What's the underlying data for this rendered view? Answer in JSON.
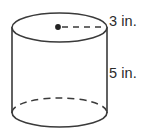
{
  "figure": {
    "type": "cylinder-diagram",
    "shape_name": "cylinder",
    "background_color": "#ffffff",
    "stroke_color": "#3a3a3a",
    "text_color": "#2b2b2b",
    "labels": {
      "radius": "3 in.",
      "height": "5 in."
    },
    "measurements": {
      "radius_value": 3,
      "radius_units": "in.",
      "height_value": 5,
      "height_units": "in."
    },
    "geometry": {
      "center_x": 59.5,
      "radius_x": 47.5,
      "radius_y": 14.5,
      "top_center_y": 27.5,
      "bottom_center_y": 112.5,
      "center_dot_x": 58,
      "center_dot_y": 27,
      "center_dot_radius": 2.8,
      "radius_line_end_x": 105
    },
    "elements": {
      "top_ellipse": "solid-ellipse",
      "bottom_front_arc": "solid-arc",
      "bottom_back_arc": "dashed-arc",
      "left_side": "solid-line",
      "right_side": "solid-line",
      "radius_segment": "dashed-line",
      "center_point": "filled-dot"
    }
  }
}
